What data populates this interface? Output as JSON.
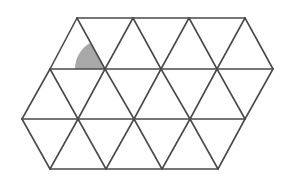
{
  "diagram": {
    "colors": {
      "background": "#ffffff",
      "line": "#4a4a4a",
      "shade": "#a8a8a8"
    },
    "stroke_width": 1.6,
    "rows": [
      {
        "y": 18,
        "x": [
          77,
          133,
          189,
          245
        ]
      },
      {
        "y": 69,
        "x": [
          50,
          105,
          161,
          217,
          273
        ]
      },
      {
        "y": 119,
        "x": [
          22,
          78,
          134,
          190,
          245
        ]
      },
      {
        "y": 169,
        "x": [
          50,
          106,
          162,
          218
        ]
      }
    ],
    "shaded_sector": {
      "center": [
        105,
        69
      ],
      "radius": 30,
      "start_angle_deg": 120,
      "end_angle_deg": 180
    }
  }
}
